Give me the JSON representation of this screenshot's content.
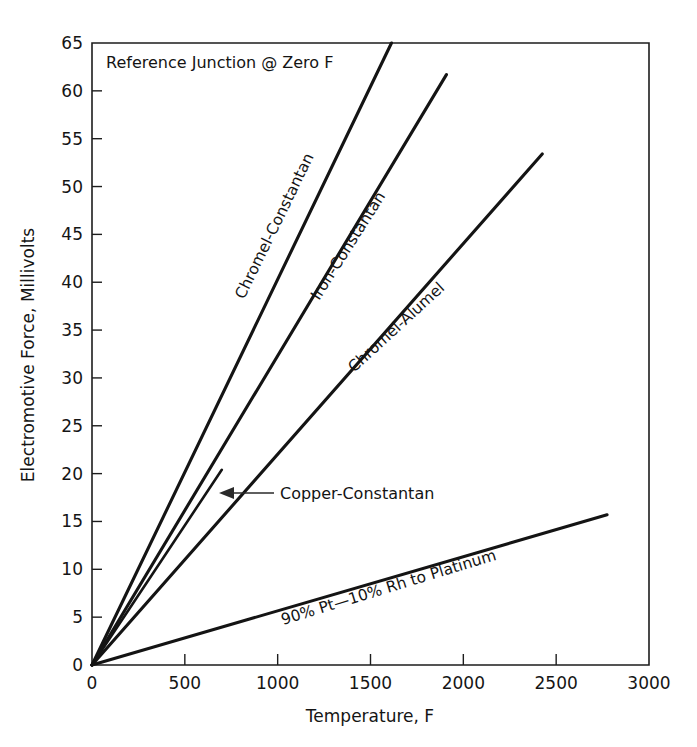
{
  "chart_data": {
    "type": "line",
    "title": "",
    "annotation": "Reference Junction @ Zero F",
    "xlabel": "Temperature, F",
    "ylabel": "Electromotive Force, Millivolts",
    "xlim": [
      0,
      3000
    ],
    "ylim": [
      0,
      65
    ],
    "grid": false,
    "legend_position": "inline-along-curves",
    "xticks": [
      0,
      500,
      1000,
      1500,
      2000,
      2500,
      3000
    ],
    "xtick_labels": [
      "0",
      "500",
      "1000",
      "1500",
      "2000",
      "2500",
      "3000"
    ],
    "yticks": [
      0,
      5,
      10,
      15,
      20,
      25,
      30,
      35,
      40,
      45,
      50,
      55,
      60,
      65
    ],
    "ytick_labels": [
      "0",
      "5",
      "10",
      "15",
      "20",
      "25",
      "30",
      "35",
      "40",
      "45",
      "50",
      "55",
      "60",
      "65"
    ],
    "series": [
      {
        "name": "Chromel-Constantan",
        "label": "Chromel-Constantan",
        "x": [
          0,
          1613
        ],
        "y": [
          0,
          65
        ],
        "color": "#141414",
        "label_x": 900,
        "label_y": 37
      },
      {
        "name": "Iron-Constantan",
        "label": "Iron-Constantan",
        "x": [
          0,
          1909
        ],
        "y": [
          0,
          61.7
        ],
        "color": "#141414",
        "label_x": 1120,
        "label_y": 36
      },
      {
        "name": "Chromel-Alumel",
        "label": "Chromel-Alumel",
        "x": [
          0,
          2425
        ],
        "y": [
          0,
          53.4
        ],
        "color": "#141414",
        "label_x": 1500,
        "label_y": 33
      },
      {
        "name": "Copper-Constantan",
        "label": "Copper-Constantan",
        "x": [
          0,
          699
        ],
        "y": [
          0,
          20.4
        ],
        "color": "#141414",
        "label_x": 1040,
        "label_y": 18.5
      },
      {
        "name": "90% Pt-10% Rh to Platinum",
        "label": "90% Pt—10% Rh to Platinum",
        "x": [
          0,
          2774
        ],
        "y": [
          0,
          15.7
        ],
        "color": "#141414",
        "label_x": 1430,
        "label_y": 9.5
      }
    ]
  },
  "axes": {
    "y_axis_title": "Electromotive Force, Millivolts",
    "x_axis_title": "Temperature, F",
    "reference_note": "Reference Junction @ Zero F"
  },
  "labels": {
    "chromel_constantan": "Chromel-Constantan",
    "iron_constantan": "Iron-Constantan",
    "chromel_alumel": "Chromel-Alumel",
    "copper_constantan": "Copper-Constantan",
    "pt_rh_platinum": "90% Pt—10% Rh to Platinum"
  },
  "ticks": {
    "x": [
      "0",
      "500",
      "1000",
      "1500",
      "2000",
      "2500",
      "3000"
    ],
    "y": [
      "0",
      "5",
      "10",
      "15",
      "20",
      "25",
      "30",
      "35",
      "40",
      "45",
      "50",
      "55",
      "60",
      "65"
    ]
  }
}
